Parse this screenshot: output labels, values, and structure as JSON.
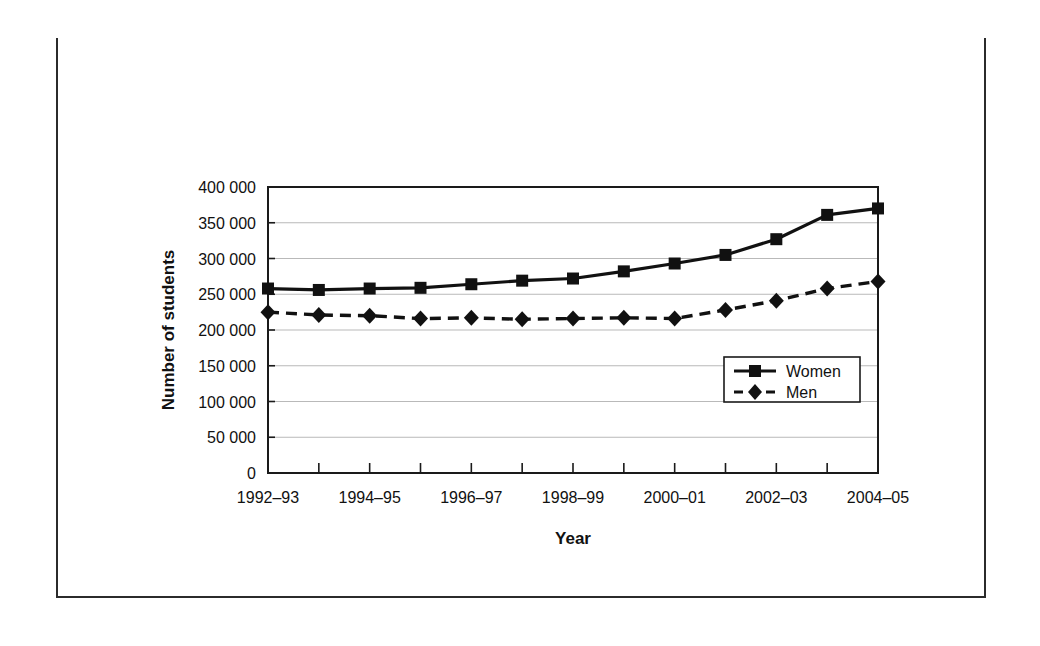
{
  "figure": {
    "number_label": "FIGURE 10-1",
    "title_line1": "Full-Time Undergraduate University Enrolment",
    "title_line2": "by Sex and Year",
    "header_bg": "#111111",
    "header_fg": "#ffffff",
    "border_color": "#2b2b2b"
  },
  "chart_data": {
    "type": "line",
    "title": "Full-Time Undergraduate University Enrolment by Sex and Year",
    "xlabel": "Year",
    "ylabel": "Number of students",
    "categories": [
      "1992–93",
      "1993–94",
      "1994–95",
      "1995–96",
      "1996–97",
      "1997–98",
      "1998–99",
      "1999–00",
      "2000–01",
      "2001–02",
      "2002–03",
      "2003–04",
      "2004–05"
    ],
    "x_tick_labels": [
      "1992–93",
      "",
      "1994–95",
      "",
      "1996–97",
      "",
      "1998–99",
      "",
      "2000–01",
      "",
      "2002–03",
      "",
      "2004–05"
    ],
    "ylim": [
      0,
      400000
    ],
    "y_ticks": [
      0,
      50000,
      100000,
      150000,
      200000,
      250000,
      300000,
      350000,
      400000
    ],
    "y_tick_labels": [
      "0",
      "50 000",
      "100 000",
      "150 000",
      "200 000",
      "250 000",
      "300 000",
      "350 000",
      "400 000"
    ],
    "grid": true,
    "legend_position": "inside-lower-right",
    "series": [
      {
        "name": "Women",
        "marker": "square",
        "linestyle": "solid",
        "color": "#111111",
        "values": [
          258000,
          256000,
          258000,
          259000,
          264000,
          269000,
          272000,
          282000,
          293000,
          305000,
          327000,
          361000,
          370000
        ]
      },
      {
        "name": "Men",
        "marker": "diamond",
        "linestyle": "dashed",
        "color": "#111111",
        "values": [
          225000,
          221000,
          220000,
          216000,
          217000,
          215000,
          216000,
          217000,
          216000,
          228000,
          241000,
          258000,
          268000
        ]
      }
    ]
  },
  "legend": {
    "items": [
      {
        "label": "Women"
      },
      {
        "label": "Men"
      }
    ]
  }
}
